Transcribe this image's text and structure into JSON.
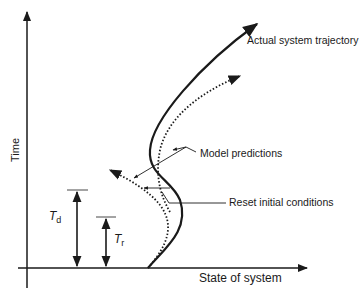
{
  "diagram": {
    "axes": {
      "y_label": "Time",
      "x_label": "State of system"
    },
    "labels": {
      "actual": "Actual system trajectory",
      "model": "Model predictions",
      "reset": "Reset initial conditions"
    },
    "intervals": {
      "td_main": "T",
      "td_sub": "d",
      "tr_main": "T",
      "tr_sub": "r"
    },
    "colors": {
      "stroke": "#1a1a1a",
      "background": "#ffffff"
    }
  }
}
